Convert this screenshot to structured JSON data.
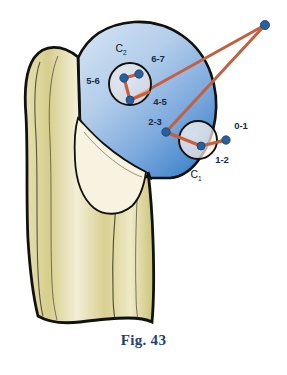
{
  "figure": {
    "caption": "Fig. 43",
    "caption_color": "#1f3f7a"
  },
  "colors": {
    "bone_outline": "#1a1a16",
    "bone_fill_dark": "#cfc77e",
    "bone_fill_mid": "#ddd69a",
    "bone_fill_light": "#efe9c4",
    "bone_fill_pale": "#f6f2dd",
    "epiphysis_light": "#c3d6ee",
    "epiphysis_mid": "#9dbde4",
    "epiphysis_dark": "#4e8fd0",
    "circle_fill": "#fdeee6",
    "marker_dot": "#2a5f9e",
    "connector_line": "#c4603f",
    "label_text": "#1a2a4a"
  },
  "labels": {
    "center_c2": "C",
    "center_c2_sub": "2",
    "center_c1": "C",
    "center_c1_sub": "1",
    "interval_0_1": "0-1",
    "interval_1_2": "1-2",
    "interval_2_3": "2-3",
    "interval_4_5": "4-5",
    "interval_5_6": "5-6",
    "interval_6_7": "6-7"
  },
  "markers": {
    "apex": {
      "label": "apex-vertex",
      "x": 265,
      "y": 25
    },
    "c2_upper_left": {
      "x": 124,
      "y": 78
    },
    "c2_upper_right": {
      "x": 139,
      "y": 74
    },
    "c2_lower": {
      "x": 130,
      "y": 100
    },
    "hinge_2_3": {
      "x": 166,
      "y": 132
    },
    "c1_inner": {
      "x": 201,
      "y": 146
    },
    "outer_0_1": {
      "x": 226,
      "y": 140
    }
  },
  "circles": {
    "c2": {
      "cx": 130,
      "cy": 84,
      "r": 21
    },
    "c1": {
      "cx": 198,
      "cy": 140,
      "r": 19
    }
  }
}
